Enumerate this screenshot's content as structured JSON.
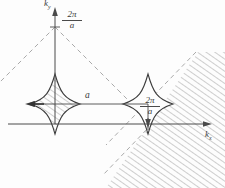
{
  "figure": {
    "background_color": "#fdfdfd",
    "line_color": "#3a3a3a",
    "hatch_color": "#8a8a8a",
    "dash_color": "#9a9a9a"
  },
  "axes": {
    "x_label_main": "k",
    "x_label_sub": "x",
    "y_label_main": "k",
    "y_label_sub": "y",
    "origin": {
      "x": 55,
      "y": 124
    }
  },
  "labels": {
    "top_fraction": {
      "numerator": "2π",
      "denominator": "a"
    },
    "right_fraction": {
      "numerator": "2π",
      "denominator": "a"
    },
    "distance": "a"
  },
  "shapes": [
    {
      "name": "left-fermi-surface",
      "center": {
        "x": 55,
        "y": 124
      },
      "hatched_inside": true
    },
    {
      "name": "right-fermi-surface",
      "center": {
        "x": 148,
        "y": 124
      },
      "hatched_inside": false
    }
  ]
}
